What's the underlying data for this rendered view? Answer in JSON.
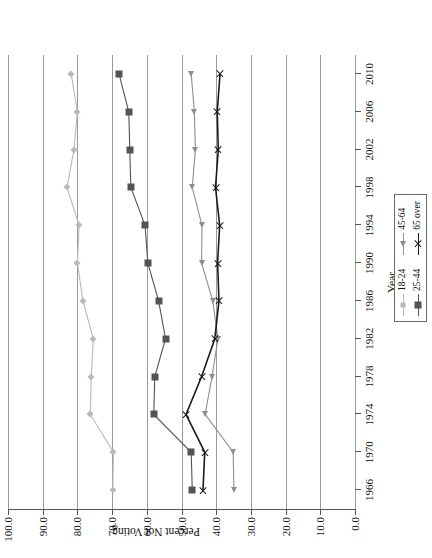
{
  "chart_data": {
    "type": "line",
    "title": "",
    "xlabel": "Year",
    "ylabel": "Percent Not Voting",
    "grid": true,
    "legend_position": "bottom-right",
    "xlim": [
      1964,
      2012
    ],
    "ylim": [
      0.0,
      100.0
    ],
    "x_tick_labels": [
      "1966",
      "1970",
      "1974",
      "1978",
      "1982",
      "1986",
      "1990",
      "1994",
      "1998",
      "2002",
      "2006",
      "2010"
    ],
    "y_tick_labels": [
      "0.0",
      "10.0",
      "20.0",
      "30.0",
      "40.0",
      "50.0",
      "60.0",
      "70.0",
      "80.0",
      "90.0",
      "100.0"
    ],
    "y_ticks": [
      0,
      10,
      20,
      30,
      40,
      50,
      60,
      70,
      80,
      90,
      100
    ],
    "x": [
      1966,
      1970,
      1974,
      1978,
      1982,
      1986,
      1990,
      1994,
      1998,
      2002,
      2006,
      2010
    ],
    "series": [
      {
        "name": "18-24",
        "marker": "diamond",
        "color": "#b9b9b9",
        "values": [
          69.8,
          69.6,
          76.3,
          76.0,
          75.4,
          78.4,
          80.0,
          79.5,
          83.0,
          81.0,
          80.0,
          81.8
        ]
      },
      {
        "name": "25-44",
        "marker": "square",
        "color": "#545454",
        "values": [
          46.9,
          47.2,
          58.0,
          57.7,
          54.6,
          56.6,
          59.7,
          60.5,
          64.6,
          64.9,
          65.2,
          68.0
        ]
      },
      {
        "name": "45-64",
        "marker": "triangle",
        "color": "#8e8e8e",
        "values": [
          34.9,
          35.1,
          43.2,
          41.2,
          39.5,
          41.0,
          44.2,
          44.1,
          46.9,
          46.0,
          46.3,
          47.2
        ]
      },
      {
        "name": "65 over",
        "marker": "x",
        "color": "#1a1a1a",
        "values": [
          43.8,
          43.3,
          48.7,
          44.2,
          40.4,
          39.2,
          39.6,
          39.0,
          40.2,
          39.4,
          39.7,
          38.9
        ]
      }
    ]
  },
  "axis": {
    "x_title": "Year",
    "y_title": "Percent Not Voting"
  },
  "legend": {
    "column_left": [
      "18-24",
      "25-44"
    ],
    "column_right": [
      "45-64",
      "65 over"
    ]
  }
}
